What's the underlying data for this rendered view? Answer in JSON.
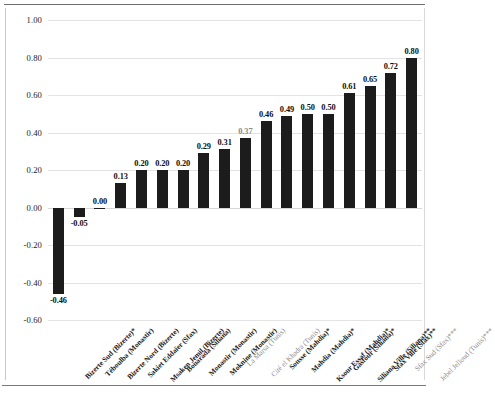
{
  "chart_data": {
    "type": "bar",
    "title": "",
    "subtitle": "",
    "xlabel": "",
    "ylabel": "",
    "ylim": [
      -0.6,
      1.0
    ],
    "ytick_step": 0.2,
    "grid": true,
    "legend": "none",
    "bar_color": "#1c1c1c",
    "categories": [
      "Bizerte Sud (Bizerte)*",
      "Téboulba (Monastir)",
      "Bizerte Nord (Bizerte)",
      "Sakiet Eddaïer (Sfax)",
      "Msaken Jemil (Bizerte)",
      "Bouarada (Siliana)",
      "Monastir (Monastir)",
      "Moknine (Monastir)",
      "La Marsa (Tunis)",
      "Cité el Khadra (Tunis)",
      "Sousse (Mahdia)*",
      "Mahdia (Mahdia)*",
      "Ksour Essaf (Mahdia)*",
      "Gasfour (Siliana)*",
      "Siliana Ville (Siliana)**",
      "Sfax Ville (Sfax)**",
      "Sfax Sud (Sfax)***",
      "Jebel Jelloud (Tunis)***"
    ],
    "values": [
      -0.46,
      -0.05,
      0.0,
      0.13,
      0.2,
      0.2,
      0.2,
      0.29,
      0.31,
      0.37,
      0.46,
      0.49,
      0.5,
      0.5,
      0.61,
      0.65,
      0.72,
      0.8
    ],
    "value_labels": [
      "-0.46",
      "-0.05",
      "0.00",
      "0.13",
      "0.20",
      "0.20",
      "0.20",
      "0.29",
      "0.31",
      "0.37",
      "0.46",
      "0.49",
      "0.50",
      "0.50",
      "0.61",
      "0.65",
      "0.72",
      "0.80"
    ],
    "ytick_labels": [
      "1.00",
      "0.80",
      "0.60",
      "0.40",
      "0.20",
      "0.00",
      "-0.20",
      "-0.40",
      "-0.60"
    ],
    "ytick_values": [
      1.0,
      0.8,
      0.6,
      0.4,
      0.2,
      0.0,
      -0.2,
      -0.4,
      -0.6
    ],
    "muted_indices": [
      8,
      9,
      16,
      17
    ]
  }
}
